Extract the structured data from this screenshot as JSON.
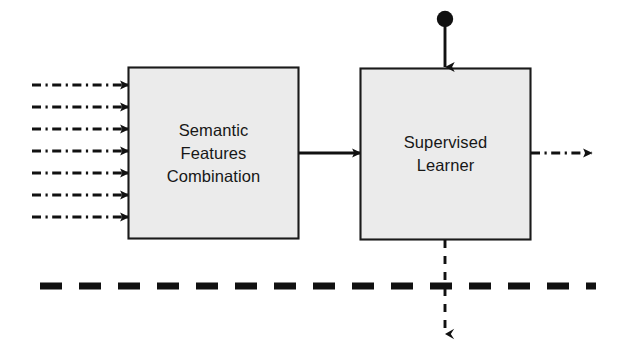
{
  "diagram": {
    "colors": {
      "box_fill": "#ebebeb",
      "box_stroke": "#1a1a1a",
      "line": "#111111",
      "text": "#171717",
      "background": "#ffffff"
    },
    "blocks": [
      {
        "id": "semantic-features-combination",
        "name": "semantic-features-combination-box",
        "lines": [
          "Semantic",
          "Features",
          "Combination"
        ],
        "x": 128,
        "y": 67,
        "width": 171,
        "height": 172
      },
      {
        "id": "supervised-learner",
        "name": "supervised-learner-box",
        "lines": [
          "Supervised",
          "Learner"
        ],
        "x": 360,
        "y": 68,
        "width": 171,
        "height": 172
      }
    ],
    "input_arrows": {
      "name": "input-feature-arrows",
      "count": 7,
      "style": "dash-dot",
      "x_start": 32,
      "x_end": 128,
      "y_values": [
        85,
        107,
        129,
        151,
        173,
        195,
        217
      ]
    },
    "connector_arrow": {
      "name": "combination-to-learner-arrow",
      "style": "solid",
      "from_x": 299,
      "to_x": 360,
      "y": 153
    },
    "output_arrow": {
      "name": "learner-output-arrow",
      "style": "dash-dot",
      "from_x": 531,
      "to_x": 592,
      "y": 153
    },
    "top_input": {
      "name": "labelled-input-arrow",
      "style": "solid-with-dot",
      "dot_cx": 445,
      "dot_cy": 19,
      "dot_r": 8,
      "from_y": 27,
      "to_y": 67,
      "x": 445
    },
    "bottom_output": {
      "name": "learner-feedback-arrow",
      "style": "dashed",
      "x": 445,
      "from_y": 240,
      "to_y": 334
    },
    "separator": {
      "name": "phase-separator-line",
      "style": "thick-dashed",
      "x_start": 40,
      "x_end": 596,
      "y": 286,
      "thickness": 7
    }
  }
}
